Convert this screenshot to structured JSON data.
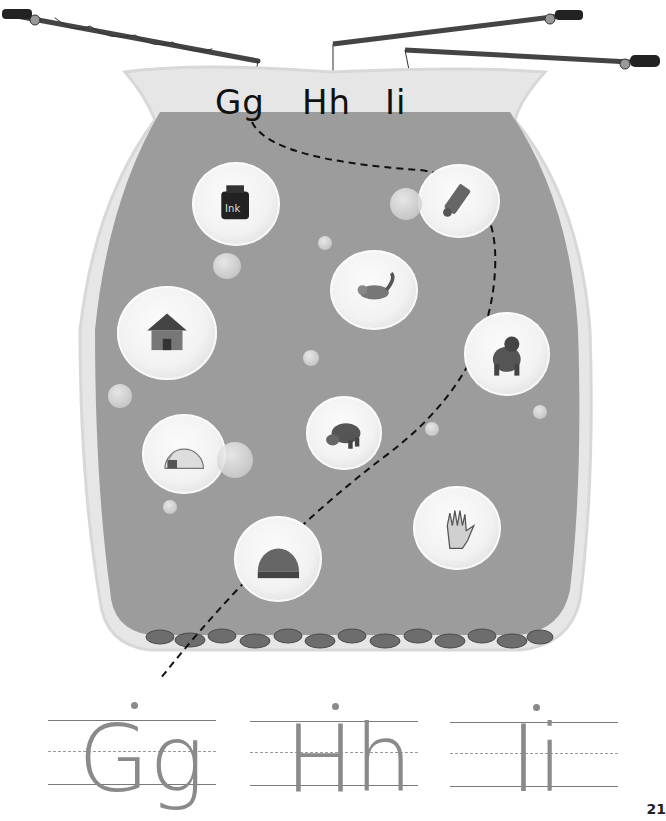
{
  "jar": {
    "letters": [
      "Gg",
      "Hh",
      "Ii"
    ],
    "water_color": "#9c9c9c",
    "jar_color": "#e6e6e6"
  },
  "bubbles": [
    {
      "name": "ink",
      "picture": "ink-bottle",
      "label": "Ink"
    },
    {
      "name": "paint",
      "picture": "paint-tube"
    },
    {
      "name": "iguana",
      "picture": "iguana"
    },
    {
      "name": "house",
      "picture": "house"
    },
    {
      "name": "gorilla",
      "picture": "gorilla"
    },
    {
      "name": "igloo",
      "picture": "igloo"
    },
    {
      "name": "hippo",
      "picture": "hippo"
    },
    {
      "name": "hand",
      "picture": "hand"
    },
    {
      "name": "grass",
      "picture": "grass-patch"
    }
  ],
  "tracing": {
    "letters": [
      "Gg",
      "Hh",
      "Ii"
    ]
  },
  "page_number": "21"
}
